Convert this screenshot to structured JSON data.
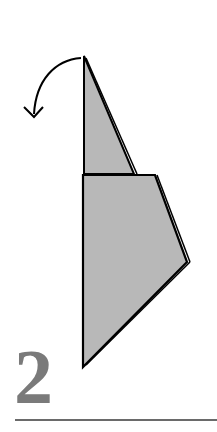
{
  "diagram": {
    "type": "origami-fold-step",
    "step_number": "2",
    "fill_color": "#b8b8b8",
    "stroke_color": "#000000",
    "number_color": "#7a7a7a",
    "arrow": "fold-back-arrow"
  }
}
